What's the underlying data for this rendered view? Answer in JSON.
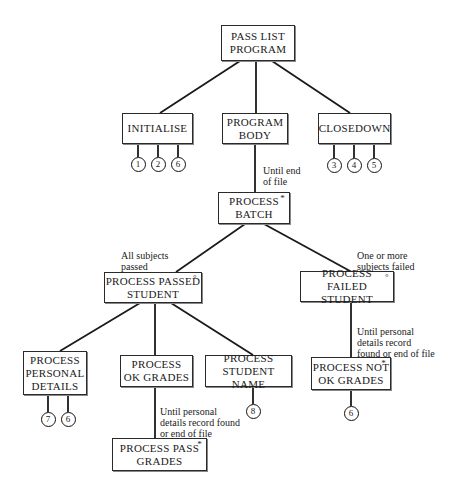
{
  "diagram": {
    "title": "PASS LIST PROGRAM",
    "line_color": "#1a1a1a",
    "nodes": [
      {
        "id": "pass-list-program",
        "label": "PASS LIST\nPROGRAM",
        "marker": "",
        "x": 221,
        "y": 25,
        "w": 74,
        "h": 36
      },
      {
        "id": "initialise",
        "label": "INITIALISE",
        "marker": "",
        "x": 122,
        "y": 113,
        "w": 71,
        "h": 31
      },
      {
        "id": "program-body",
        "label": "PROGRAM\nBODY",
        "marker": "",
        "x": 222,
        "y": 113,
        "w": 66,
        "h": 31
      },
      {
        "id": "closedown",
        "label": "CLOSEDOWN",
        "marker": "",
        "x": 318,
        "y": 113,
        "w": 73,
        "h": 31
      },
      {
        "id": "process-batch",
        "label": "PROCESS\nBATCH",
        "marker": "*",
        "x": 218,
        "y": 192,
        "w": 72,
        "h": 32
      },
      {
        "id": "process-passed-student",
        "label": "PROCESS PASSED\nSTUDENT",
        "marker": "°",
        "x": 104,
        "y": 272,
        "w": 98,
        "h": 31
      },
      {
        "id": "process-failed-student",
        "label": "PROCESS FAILED\nSTUDENT",
        "marker": "°",
        "x": 300,
        "y": 271,
        "w": 94,
        "h": 31
      },
      {
        "id": "process-personal-details",
        "label": "PROCESS\nPERSONAL\nDETAILS",
        "marker": "",
        "x": 23,
        "y": 351,
        "w": 64,
        "h": 44
      },
      {
        "id": "process-ok-grades",
        "label": "PROCESS\nOK GRADES",
        "marker": "",
        "x": 120,
        "y": 355,
        "w": 73,
        "h": 32
      },
      {
        "id": "process-student-name",
        "label": "PROCESS\nSTUDENT NAME",
        "marker": "",
        "x": 205,
        "y": 355,
        "w": 87,
        "h": 32
      },
      {
        "id": "process-not-ok-grades",
        "label": "PROCESS NOT\nOK GRADES",
        "marker": "*",
        "x": 311,
        "y": 357,
        "w": 80,
        "h": 33
      },
      {
        "id": "process-pass-grades",
        "label": "PROCESS PASS\nGRADES",
        "marker": "*",
        "x": 112,
        "y": 438,
        "w": 95,
        "h": 33
      }
    ],
    "edges": [
      {
        "from": "pass-list-program",
        "to": "initialise",
        "x1": 240,
        "y1": 61,
        "x2": 160,
        "y2": 113
      },
      {
        "from": "pass-list-program",
        "to": "program-body",
        "x1": 256,
        "y1": 61,
        "x2": 256,
        "y2": 113
      },
      {
        "from": "pass-list-program",
        "to": "closedown",
        "x1": 272,
        "y1": 61,
        "x2": 350,
        "y2": 113
      },
      {
        "from": "program-body",
        "to": "process-batch",
        "x1": 255,
        "y1": 144,
        "x2": 255,
        "y2": 192
      },
      {
        "from": "process-batch",
        "to": "process-passed-student",
        "x1": 245,
        "y1": 224,
        "x2": 176,
        "y2": 272
      },
      {
        "from": "process-batch",
        "to": "process-failed-student",
        "x1": 264,
        "y1": 224,
        "x2": 350,
        "y2": 271
      },
      {
        "from": "process-passed-student",
        "to": "process-personal-details",
        "x1": 140,
        "y1": 303,
        "x2": 60,
        "y2": 351
      },
      {
        "from": "process-passed-student",
        "to": "process-ok-grades",
        "x1": 155,
        "y1": 303,
        "x2": 155,
        "y2": 355
      },
      {
        "from": "process-passed-student",
        "to": "process-student-name",
        "x1": 171,
        "y1": 303,
        "x2": 253,
        "y2": 355
      },
      {
        "from": "process-failed-student",
        "to": "process-not-ok-grades",
        "x1": 351,
        "y1": 302,
        "x2": 351,
        "y2": 357
      },
      {
        "from": "process-ok-grades",
        "to": "process-pass-grades",
        "x1": 155,
        "y1": 387,
        "x2": 155,
        "y2": 438
      }
    ],
    "operations": [
      {
        "parent": "initialise",
        "number": "1",
        "cx": 138,
        "cy": 164,
        "stem_top": 144
      },
      {
        "parent": "initialise",
        "number": "2",
        "cx": 158,
        "cy": 164,
        "stem_top": 144
      },
      {
        "parent": "initialise",
        "number": "6",
        "cx": 178,
        "cy": 164,
        "stem_top": 144
      },
      {
        "parent": "closedown",
        "number": "3",
        "cx": 334,
        "cy": 165,
        "stem_top": 144
      },
      {
        "parent": "closedown",
        "number": "4",
        "cx": 354,
        "cy": 165,
        "stem_top": 144
      },
      {
        "parent": "closedown",
        "number": "5",
        "cx": 374,
        "cy": 165,
        "stem_top": 144
      },
      {
        "parent": "process-personal-details",
        "number": "7",
        "cx": 48,
        "cy": 419,
        "stem_top": 395
      },
      {
        "parent": "process-personal-details",
        "number": "6",
        "cx": 68,
        "cy": 419,
        "stem_top": 395
      },
      {
        "parent": "process-student-name",
        "number": "8",
        "cx": 253,
        "cy": 411,
        "stem_top": 387
      },
      {
        "parent": "process-not-ok-grades",
        "number": "6",
        "cx": 351,
        "cy": 413,
        "stem_top": 390
      }
    ],
    "conditions": [
      {
        "text": "Until end\nof file",
        "x": 263,
        "y": 165
      },
      {
        "text": "All subjects\npassed",
        "x": 121,
        "y": 250
      },
      {
        "text": "One or more\nsubjects failed",
        "x": 357,
        "y": 250
      },
      {
        "text": "Until personal\ndetails record\nfound or end of file",
        "x": 357,
        "y": 326
      },
      {
        "text": "Until personal\ndetails record found\nor end of file",
        "x": 160,
        "y": 406
      }
    ]
  }
}
